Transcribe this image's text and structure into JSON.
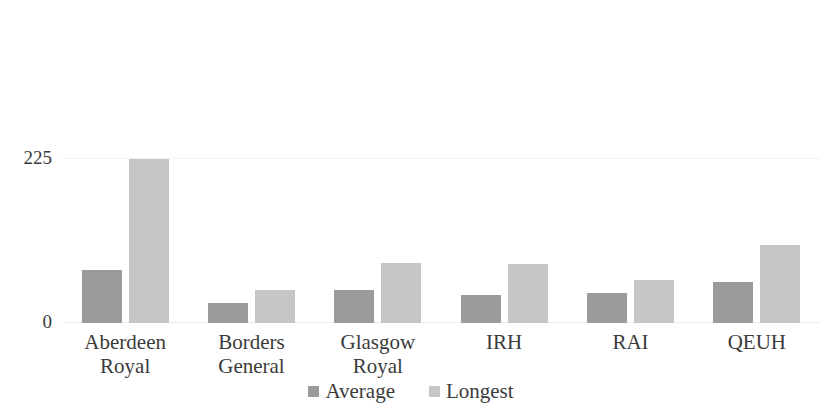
{
  "chart_data": {
    "type": "bar",
    "title": "",
    "subtitle": "",
    "xlabel": "",
    "ylabel": "",
    "ylim": [
      0,
      225
    ],
    "yticks": [
      "0",
      "225"
    ],
    "grid": true,
    "legend_position": "bottom",
    "categories": [
      {
        "line1": "Aberdeen",
        "line2": "Royal"
      },
      {
        "line1": "Borders",
        "line2": "General"
      },
      {
        "line1": "Glasgow",
        "line2": "Royal"
      },
      {
        "line1": "IRH",
        "line2": ""
      },
      {
        "line1": "RAI",
        "line2": ""
      },
      {
        "line1": "QEUH",
        "line2": ""
      }
    ],
    "series": [
      {
        "name": "Average",
        "color": "#9b9b9b",
        "values": [
          72,
          27,
          45,
          38,
          41,
          56
        ]
      },
      {
        "name": "Longest",
        "color": "#c6c6c6",
        "values": [
          224,
          45,
          82,
          80,
          59,
          106
        ]
      }
    ]
  }
}
